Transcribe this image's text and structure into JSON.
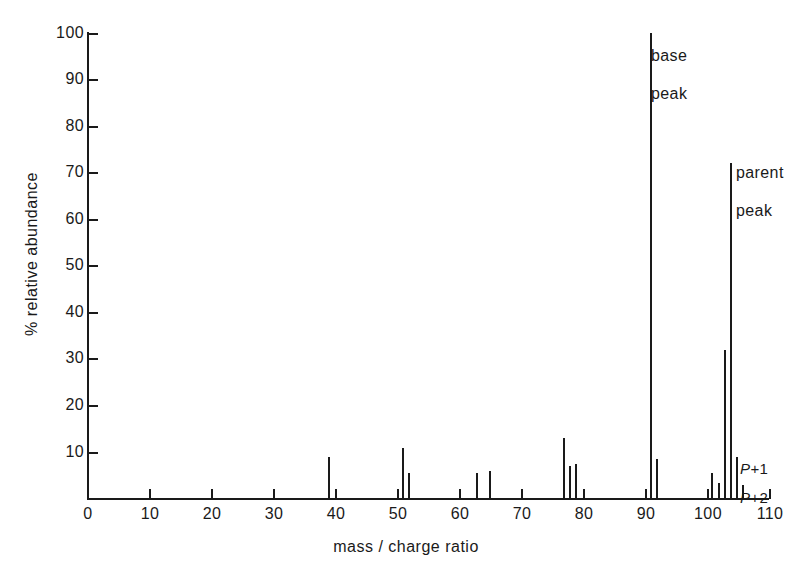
{
  "chart_data": {
    "type": "bar",
    "title": "",
    "subtitle": "",
    "xlabel": "mass / charge ratio",
    "ylabel": "% relative abundance",
    "xlim": [
      0,
      110
    ],
    "ylim": [
      0,
      100
    ],
    "grid": false,
    "legend": "none",
    "x_ticks": [
      0,
      10,
      20,
      30,
      40,
      50,
      60,
      70,
      80,
      90,
      100,
      110
    ],
    "x_tick_labels": [
      "0",
      "10",
      "20",
      "30",
      "40",
      "50",
      "60",
      "70",
      "80",
      "90",
      "100",
      "110"
    ],
    "y_ticks": [
      0,
      10,
      20,
      30,
      40,
      50,
      60,
      70,
      80,
      90,
      100
    ],
    "y_tick_labels": [
      "0",
      "10",
      "20",
      "30",
      "40",
      "50",
      "60",
      "70",
      "80",
      "90",
      "100"
    ],
    "x": [
      39,
      51,
      52,
      63,
      65,
      77,
      78,
      79,
      91,
      92,
      101,
      102,
      103,
      104,
      105,
      106
    ],
    "values": [
      9,
      11,
      5.5,
      5.5,
      6,
      13,
      7,
      7.5,
      100,
      8.5,
      5.5,
      3.5,
      32,
      72,
      9,
      3
    ],
    "points": [
      {
        "mz": 39,
        "abundance": 9
      },
      {
        "mz": 51,
        "abundance": 11
      },
      {
        "mz": 52,
        "abundance": 5.5
      },
      {
        "mz": 63,
        "abundance": 5.5
      },
      {
        "mz": 65,
        "abundance": 6
      },
      {
        "mz": 77,
        "abundance": 13
      },
      {
        "mz": 78,
        "abundance": 7
      },
      {
        "mz": 79,
        "abundance": 7.5
      },
      {
        "mz": 91,
        "abundance": 100
      },
      {
        "mz": 92,
        "abundance": 8.5
      },
      {
        "mz": 101,
        "abundance": 5.5
      },
      {
        "mz": 102,
        "abundance": 3.5
      },
      {
        "mz": 103,
        "abundance": 32
      },
      {
        "mz": 104,
        "abundance": 72
      },
      {
        "mz": 105,
        "abundance": 9
      },
      {
        "mz": 106,
        "abundance": 3
      }
    ],
    "annotations": [
      {
        "id": "base-peak",
        "text": "base\npeak",
        "mz": 91,
        "abundance": 100
      },
      {
        "id": "parent-peak",
        "text": "parent\npeak",
        "mz": 104,
        "abundance": 72
      },
      {
        "id": "p-plus-1",
        "text_italic": "P",
        "text_rest": "+1",
        "mz": 105,
        "abundance": 9
      },
      {
        "id": "p-plus-2",
        "text_italic": "P",
        "text_rest": "+2",
        "mz": 106,
        "abundance": 3
      }
    ]
  },
  "labels": {
    "y_axis_title": "% relative abundance",
    "x_axis_title": "mass / charge ratio",
    "y_100": "100",
    "y_90": "90",
    "y_80": "80",
    "y_70": "70",
    "y_60": "60",
    "y_50": "50",
    "y_40": "40",
    "y_30": "30",
    "y_20": "20",
    "y_10": "10",
    "x_0": "0",
    "x_10": "10",
    "x_20": "20",
    "x_30": "30",
    "x_40": "40",
    "x_50": "50",
    "x_60": "60",
    "x_70": "70",
    "x_80": "80",
    "x_90": "90",
    "x_100": "100",
    "x_110": "110",
    "base_peak_line1": "base",
    "base_peak_line2": "peak",
    "parent_peak_line1": "parent",
    "parent_peak_line2": "peak",
    "p_plus_1_italic": "P",
    "p_plus_1_rest": "+1",
    "p_plus_2_italic": "P",
    "p_plus_2_rest": "+2"
  },
  "colors": {
    "ink": "#1a1a1a",
    "background": "#ffffff"
  }
}
